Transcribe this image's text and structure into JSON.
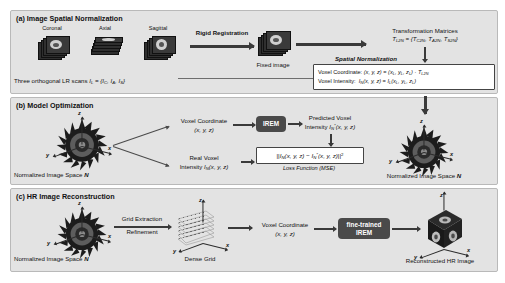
{
  "colors": {
    "panel_bg": "#e3e3e3",
    "panel_border": "#b9b9b9",
    "arrow": "#3a3a3a",
    "chip_bg": "#4a4a4a",
    "chip_text": "#ffffff",
    "box_bg": "#ffffff",
    "box_border": "#444444",
    "volume": "#2f2f2f",
    "page_bg": "#ffffff"
  },
  "panel_a": {
    "title": "(a) Image Spatial Normalization",
    "scan_labels": [
      "Coronal",
      "Axial",
      "Sagittal"
    ],
    "caption": "Three orthogonal LR scans",
    "caption_formula_lhs": "I",
    "caption_formula_lhs_sub": "L",
    "caption_formula_rhs": "= {I",
    "caption_formula_full": "Three orthogonal LR scans I_L = {I_C, I_A, I_S}",
    "rigid_registration_label": "Rigid Registration",
    "fixed_image_label": "Fixed image",
    "transformation_title": "Transformation Matrices",
    "transformation_formula": "T_L2N = {T_C2N, T_A2N, T_S2N}",
    "spatial_normalization_label": "Spatial Normalization",
    "voxel_coordinate_line": "Voxel Coordinate: (x, y, z) = (x_L, y_L, z_L) · T_L2N",
    "voxel_intensity_line": "Voxel Intensity:  I_N(x, y, z) = I_L(x_L, y_L, z_L)"
  },
  "panel_b": {
    "title": "(b) Model Optimization",
    "left_space_label": "Normalized Image Space",
    "left_space_symbol": "N",
    "voxel_coordinate_label": "Voxel Coordinate",
    "voxel_coordinate_value": "(x, y, z)",
    "real_voxel_label": "Real Voxel",
    "real_voxel_value": "Intensity I_N(x, y, z)",
    "model_chip_label": "IREM",
    "predicted_label": "Predicted Voxel",
    "predicted_value": "Intensity I*_N(x, y, z)",
    "loss_formula": "||I_N(x, y, z) − I*_N(x, y, z)||^2",
    "loss_caption": "Loss Function (MSE)",
    "right_space_label": "Normalized Image Space",
    "right_space_symbol": "N"
  },
  "panel_c": {
    "title": "(c) HR Image Reconstruction",
    "left_space_label": "Normalized Image Space",
    "left_space_symbol": "N",
    "grid_extraction_label": "Grid Extraction",
    "refinement_label": "Refinement",
    "dense_grid_label": "Dense Grid",
    "voxel_coordinate_label": "Voxel Coordinate",
    "voxel_coordinate_value": "(x, y, z)",
    "model_chip_label_line1": "fine-trained",
    "model_chip_label_line2": "IREM",
    "output_label": "Reconstructed HR Image"
  },
  "axes": {
    "x": "x",
    "y": "y",
    "z": "z"
  }
}
